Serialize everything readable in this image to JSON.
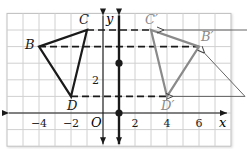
{
  "diagram": {
    "grid": {
      "origin_px": [
        103,
        113
      ],
      "unit_x_px": 16,
      "unit_y_px": 16.6,
      "x_range": [
        -6,
        8
      ],
      "y_range": [
        -2,
        6
      ],
      "line_color": "#d0d0d0",
      "border_color": "#bfbfbf"
    },
    "axes": {
      "x_label": "x",
      "y_label": "y",
      "origin_label": "O",
      "x_ticks": [
        {
          "value": -4,
          "label": "−4"
        },
        {
          "value": -2,
          "label": "−2"
        },
        {
          "value": 2,
          "label": "2"
        },
        {
          "value": 4,
          "label": "4"
        },
        {
          "value": 6,
          "label": "6"
        }
      ],
      "y_ticks": [
        {
          "value": 2,
          "label": "2"
        }
      ]
    },
    "line_of_reflection": {
      "x": 1,
      "color": "#1a1a1a",
      "points": [
        [
          1,
          3
        ],
        [
          1,
          0
        ]
      ]
    },
    "preimage": {
      "color": "#1a1a1a",
      "vertices": [
        {
          "name": "B",
          "label": "B",
          "x": -4,
          "y": 4
        },
        {
          "name": "C",
          "label": "C",
          "x": -1,
          "y": 5
        },
        {
          "name": "D",
          "label": "D",
          "x": -2,
          "y": 1
        }
      ]
    },
    "image": {
      "color": "#8a8a8a",
      "vertices": [
        {
          "name": "B'",
          "label": "B′",
          "x": 6,
          "y": 4
        },
        {
          "name": "C'",
          "label": "C′",
          "x": 3,
          "y": 5
        },
        {
          "name": "D'",
          "label": "D′",
          "x": 4,
          "y": 1
        }
      ]
    },
    "dashed_connectors": [
      {
        "from": "C",
        "to": "C'"
      },
      {
        "from": "B",
        "to": "B'"
      },
      {
        "from": "D",
        "to": "D'"
      }
    ],
    "callout_arrows": [
      {
        "target": "C'",
        "color": "#555555"
      },
      {
        "target": "B'",
        "color": "#555555"
      },
      {
        "target": "D'",
        "color": "#555555"
      }
    ]
  }
}
